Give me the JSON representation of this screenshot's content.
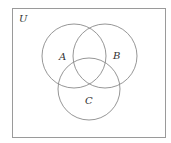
{
  "diagram": {
    "type": "venn",
    "universe": {
      "label": "U",
      "rect": {
        "x": 12,
        "y": 8,
        "width": 153,
        "height": 129
      },
      "label_pos": {
        "x": 19,
        "y": 22
      }
    },
    "sets": [
      {
        "label": "A",
        "cx": 74,
        "cy": 56,
        "r": 32,
        "label_pos": {
          "x": 59,
          "y": 60
        }
      },
      {
        "label": "B",
        "cx": 105,
        "cy": 56,
        "r": 32,
        "label_pos": {
          "x": 113,
          "y": 59
        }
      },
      {
        "label": "C",
        "cx": 89,
        "cy": 89,
        "r": 31,
        "label_pos": {
          "x": 85,
          "y": 104
        }
      }
    ],
    "stroke_color": "#8a8a8a",
    "border_color": "#9a9a9a",
    "background": "#ffffff"
  }
}
